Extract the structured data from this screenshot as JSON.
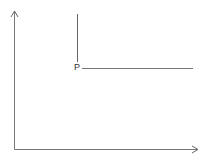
{
  "diagram": {
    "type": "axes-with-lines",
    "point_label": "P",
    "colors": {
      "axis": "#777777",
      "line": "#666666",
      "label": "#333333",
      "background": "#ffffff"
    }
  }
}
